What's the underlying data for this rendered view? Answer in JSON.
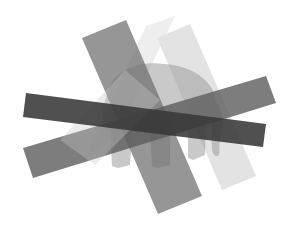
{
  "image": {
    "description": "Abstract composition of overlapping semi-transparent gray bars over an elephant silhouette",
    "background": "#ffffff",
    "colors": {
      "darkest_bar": "#3a3a3a",
      "dark_bar": "#5a5a5a",
      "medium_bar": "#7d7d7d",
      "light_bar": "#bdbdbd",
      "lightest_bar": "#d6d6d6",
      "elephant": "#a8a8a8"
    }
  }
}
